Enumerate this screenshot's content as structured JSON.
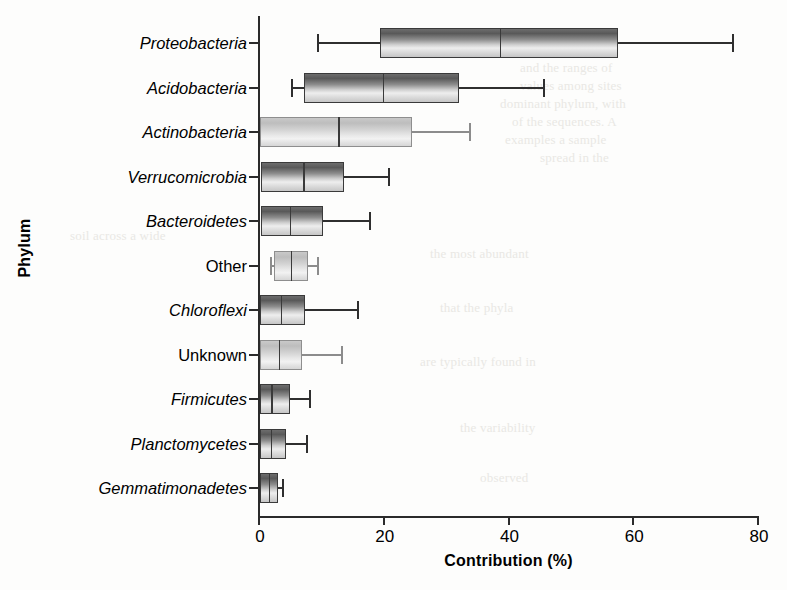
{
  "figure": {
    "ylabel": "Phylum",
    "xlabel": "Contribution (%)"
  },
  "axis": {
    "x_ticks": [
      "0",
      "20",
      "40",
      "60",
      "80"
    ]
  },
  "chart_data": {
    "type": "box",
    "orientation": "horizontal",
    "title": "",
    "xlabel": "Contribution (%)",
    "ylabel": "Phylum",
    "xlim": [
      0,
      80
    ],
    "xticks": [
      0,
      20,
      40,
      60,
      80
    ],
    "grid": false,
    "legend": null,
    "categories": [
      "Proteobacteria",
      "Acidobacteria",
      "Actinobacteria",
      "Verrucomicrobia",
      "Bacteroidetes",
      "Other",
      "Chloroflexi",
      "Unknown",
      "Firmicutes",
      "Planctomycetes",
      "Gemmatimonadetes"
    ],
    "boxes": [
      {
        "category": "Proteobacteria",
        "italic": true,
        "whisker_low": 9.5,
        "q1": 19.4,
        "median": 38.6,
        "q3": 57.5,
        "whisker_high": 76.0,
        "shade": "dark"
      },
      {
        "category": "Acidobacteria",
        "italic": true,
        "whisker_low": 5.3,
        "q1": 7.2,
        "median": 19.9,
        "q3": 32.1,
        "whisker_high": 45.7,
        "shade": "dark"
      },
      {
        "category": "Actinobacteria",
        "italic": true,
        "whisker_low": 0.0,
        "q1": 0.2,
        "median": 12.7,
        "q3": 24.5,
        "whisker_high": 33.8,
        "shade": "pale"
      },
      {
        "category": "Verrucomicrobia",
        "italic": true,
        "whisker_low": 0.0,
        "q1": 0.4,
        "median": 7.1,
        "q3": 13.6,
        "whisker_high": 20.8,
        "shade": "dark"
      },
      {
        "category": "Bacteroidetes",
        "italic": true,
        "whisker_low": 0.0,
        "q1": 0.3,
        "median": 5.0,
        "q3": 10.3,
        "whisker_high": 17.8,
        "shade": "dark"
      },
      {
        "category": "Other",
        "italic": false,
        "whisker_low": 1.9,
        "q1": 2.4,
        "median": 5.1,
        "q3": 7.9,
        "whisker_high": 9.5,
        "shade": "pale"
      },
      {
        "category": "Chloroflexi",
        "italic": true,
        "whisker_low": 0.0,
        "q1": 0.2,
        "median": 3.5,
        "q3": 7.4,
        "whisker_high": 15.9,
        "shade": "dark"
      },
      {
        "category": "Unknown",
        "italic": false,
        "whisker_low": 0.0,
        "q1": 0.2,
        "median": 3.2,
        "q3": 6.9,
        "whisker_high": 13.3,
        "shade": "pale"
      },
      {
        "category": "Firmicutes",
        "italic": true,
        "whisker_low": 0.0,
        "q1": 0.2,
        "median": 2.0,
        "q3": 5.0,
        "whisker_high": 8.2,
        "shade": "dark"
      },
      {
        "category": "Planctomycetes",
        "italic": true,
        "whisker_low": 0.0,
        "q1": 0.2,
        "median": 1.9,
        "q3": 4.3,
        "whisker_high": 7.7,
        "shade": "dark"
      },
      {
        "category": "Gemmatimonadetes",
        "italic": true,
        "whisker_low": 0.0,
        "q1": 0.2,
        "median": 1.6,
        "q3": 3.0,
        "whisker_high": 3.8,
        "shade": "dark"
      }
    ]
  },
  "background_text": {
    "lines": [
      "and the ranges of",
      "values among sites",
      "dominant phylum, with",
      "of the sequences. A",
      "examples a sample",
      "spread in the",
      "soil across a wide",
      "the most abundant",
      "that the phyla",
      "are typically found in",
      "the variability",
      "observed"
    ]
  }
}
